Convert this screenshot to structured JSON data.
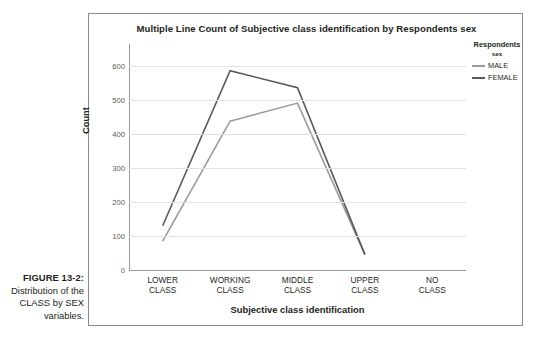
{
  "figure": {
    "label": "FIGURE 13-2:",
    "caption": "Distribution of the CLASS by SEX variables."
  },
  "chart": {
    "title": "Multiple Line Count of Subjective class identification by Respondents sex",
    "legend_title": "Respondents",
    "legend_subtitle": "sex"
  },
  "colors": {
    "male": "#9a9b96",
    "female": "#58595b",
    "grid": "#e3e3e3",
    "axis": "#9a9a9a",
    "frame": "#8c8c8c",
    "text": "#231f20"
  },
  "chart_data": {
    "type": "line",
    "title": "Multiple Line Count of Subjective class identification by Respondents sex",
    "xlabel": "Subjective class identification",
    "ylabel": "Count",
    "categories": [
      "LOWER\nCLASS",
      "WORKING\nCLASS",
      "MIDDLE\nCLASS",
      "UPPER\nCLASS",
      "NO CLASS"
    ],
    "ylim": [
      0,
      640
    ],
    "yticks": [
      0,
      100,
      200,
      300,
      400,
      500,
      600
    ],
    "ytick_labels": [
      "0",
      "100",
      "200",
      "300",
      "400",
      "500",
      "600"
    ],
    "grid": true,
    "legend_position": "right",
    "series": [
      {
        "name": "MALE",
        "color": "#9a9b96",
        "values": [
          85,
          437,
          490,
          45,
          null
        ]
      },
      {
        "name": "FEMALE",
        "color": "#58595b",
        "values": [
          130,
          585,
          535,
          45,
          null
        ]
      }
    ]
  }
}
